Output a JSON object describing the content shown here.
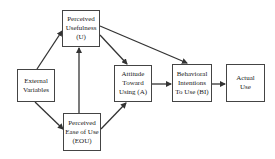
{
  "diagram": {
    "nodes": [
      {
        "id": "EV",
        "lines": [
          "External",
          "Variables"
        ]
      },
      {
        "id": "U",
        "lines": [
          "Perceived",
          "Usefulness",
          "(U)"
        ]
      },
      {
        "id": "EOU",
        "lines": [
          "Perceived",
          "Ease of Use",
          "(EOU)"
        ]
      },
      {
        "id": "A",
        "lines": [
          "Attitude",
          "Toward",
          "Using (A)"
        ]
      },
      {
        "id": "BI",
        "lines": [
          "Behavioral",
          "Intentions",
          "To Use (BI)"
        ]
      },
      {
        "id": "AU",
        "lines": [
          "Actual",
          "Use"
        ]
      }
    ],
    "edges": [
      {
        "from": "EV",
        "to": "U"
      },
      {
        "from": "EV",
        "to": "EOU"
      },
      {
        "from": "EOU",
        "to": "U"
      },
      {
        "from": "U",
        "to": "A"
      },
      {
        "from": "U",
        "to": "BI"
      },
      {
        "from": "EOU",
        "to": "A"
      },
      {
        "from": "A",
        "to": "BI"
      },
      {
        "from": "BI",
        "to": "AU"
      }
    ],
    "colors": {
      "stroke": "#444444",
      "text": "#222222",
      "background": "#ffffff"
    }
  }
}
